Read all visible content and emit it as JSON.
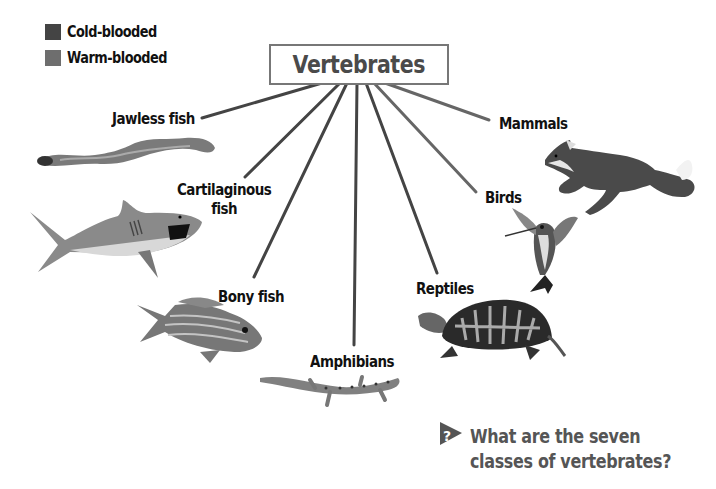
{
  "legend": {
    "items": [
      {
        "label": "Cold-blooded",
        "color": "#444444"
      },
      {
        "label": "Warm-blooded",
        "color": "#6e6e6e"
      }
    ]
  },
  "root": {
    "label": "Vertebrates",
    "border_color": "#777777",
    "text_color": "#4a4a4a"
  },
  "classes": [
    {
      "label": "Jawless fish",
      "type": "cold-blooded",
      "animal": "lamprey"
    },
    {
      "label": "Cartilaginous fish",
      "line1": "Cartilaginous",
      "line2": "fish",
      "type": "cold-blooded",
      "animal": "shark"
    },
    {
      "label": "Bony fish",
      "type": "cold-blooded",
      "animal": "striped fish"
    },
    {
      "label": "Amphibians",
      "type": "cold-blooded",
      "animal": "salamander"
    },
    {
      "label": "Reptiles",
      "type": "cold-blooded",
      "animal": "box turtle"
    },
    {
      "label": "Birds",
      "type": "warm-blooded",
      "animal": "hummingbird"
    },
    {
      "label": "Mammals",
      "type": "warm-blooded",
      "animal": "fox"
    }
  ],
  "colors": {
    "cold_line": "#444444",
    "warm_line": "#6e6e6e",
    "question": "#555555"
  },
  "question": {
    "icon": "question-arrow-icon",
    "line1": "What are the seven",
    "line2": "classes of vertebrates?"
  }
}
